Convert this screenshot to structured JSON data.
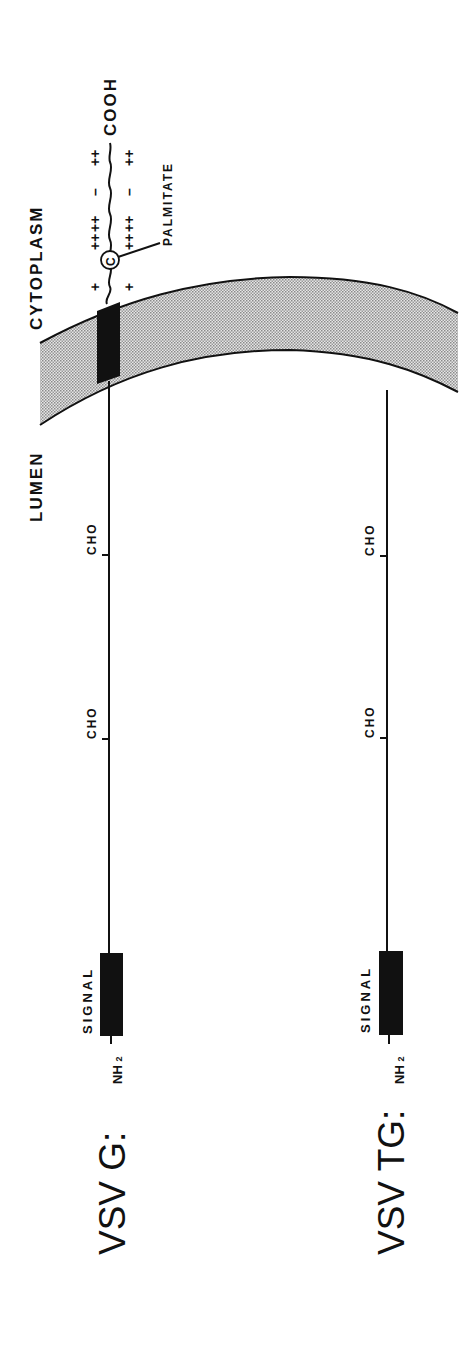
{
  "diagram": {
    "orientation": "rotated-90-ccw",
    "compartments": {
      "cytoplasm_label": "CYTOPLASM",
      "lumen_label": "LUMEN"
    },
    "constructs": [
      {
        "name_label": "VSV G:",
        "n_terminus_label": "NH",
        "n_terminus_subscript": "2",
        "signal_label": "SIGNAL",
        "glycosylation_sites": [
          "CHO",
          "CHO"
        ],
        "transmembrane_domain": true,
        "cytoplasmic_tail": {
          "c_terminus_label": "COOH",
          "modification_label": "PALMITATE",
          "modified_residue_label": "C",
          "charges_upper": [
            "+",
            "++",
            "++",
            "–",
            "++"
          ],
          "charges_lower": [
            "+",
            "++",
            "++",
            "–",
            "++"
          ]
        }
      },
      {
        "name_label": "VSV TG:",
        "n_terminus_label": "NH",
        "n_terminus_subscript": "2",
        "signal_label": "SIGNAL",
        "glycosylation_sites": [
          "CHO",
          "CHO"
        ],
        "transmembrane_domain": false
      }
    ],
    "colors": {
      "ink": "#111111",
      "membrane_fill": "#bdbdbd",
      "background": "#ffffff"
    }
  }
}
